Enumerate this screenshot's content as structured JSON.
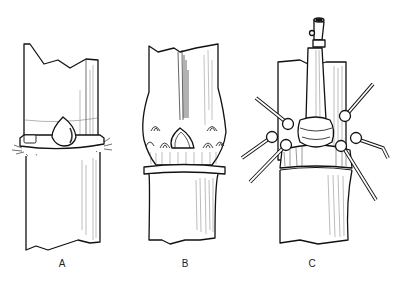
{
  "figure": {
    "panels": [
      {
        "id": "A",
        "label": "A",
        "description": "bamboo node with bud and hairy ring"
      },
      {
        "id": "B",
        "label": "B",
        "description": "swollen node with bud and scale scars"
      },
      {
        "id": "C",
        "label": "C",
        "description": "node with central branch and lateral branches"
      }
    ]
  }
}
